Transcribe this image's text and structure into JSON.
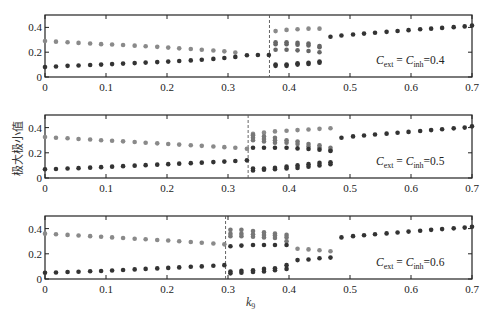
{
  "chart_data": [
    {
      "type": "scatter",
      "annotation": {
        "c1": "C",
        "s1": "ext",
        "eq": " = ",
        "c2": "C",
        "s2": "inh",
        "val": "=0.4"
      },
      "xlim": [
        0,
        0.7
      ],
      "ylim": [
        0,
        0.5
      ],
      "xticks": [
        "0",
        "0.1",
        "0.2",
        "0.3",
        "0.4",
        "0.5",
        "0.6",
        "0.7"
      ],
      "yticks": [
        "0",
        "0.2",
        "0.4"
      ],
      "dashed_x": 0.368,
      "series": [
        {
          "name": "upper",
          "color": "#8a8a8a",
          "x": [
            0,
            0.018,
            0.037,
            0.055,
            0.074,
            0.092,
            0.11,
            0.128,
            0.147,
            0.165,
            0.184,
            0.202,
            0.22,
            0.239,
            0.257,
            0.276,
            0.294,
            0.312
          ],
          "y": [
            0.29,
            0.285,
            0.28,
            0.275,
            0.27,
            0.265,
            0.262,
            0.258,
            0.253,
            0.248,
            0.243,
            0.237,
            0.231,
            0.226,
            0.22,
            0.214,
            0.207,
            0.198
          ]
        },
        {
          "name": "lower",
          "color": "#333333",
          "x": [
            0,
            0.018,
            0.037,
            0.055,
            0.074,
            0.092,
            0.11,
            0.128,
            0.147,
            0.165,
            0.184,
            0.202,
            0.22,
            0.239,
            0.257,
            0.276,
            0.294,
            0.312,
            0.331,
            0.349,
            0.367
          ],
          "y": [
            0.08,
            0.085,
            0.09,
            0.093,
            0.097,
            0.1,
            0.104,
            0.108,
            0.112,
            0.116,
            0.12,
            0.124,
            0.129,
            0.134,
            0.139,
            0.146,
            0.153,
            0.162,
            0.175,
            0.178,
            0.178
          ]
        },
        {
          "name": "periodic-high",
          "color": "#8a8a8a",
          "x": [
            0.378,
            0.396,
            0.414,
            0.432,
            0.45
          ],
          "y": [
            0.37,
            0.38,
            0.385,
            0.39,
            0.39
          ]
        },
        {
          "name": "periodic-mid",
          "color": "#666666",
          "x": [
            0.378,
            0.378,
            0.396,
            0.396,
            0.414,
            0.414,
            0.432,
            0.432,
            0.45,
            0.45,
            0.378,
            0.396,
            0.414,
            0.432,
            0.45
          ],
          "y": [
            0.28,
            0.265,
            0.28,
            0.265,
            0.275,
            0.26,
            0.27,
            0.255,
            0.25,
            0.24,
            0.22,
            0.22,
            0.215,
            0.21,
            0.2
          ]
        },
        {
          "name": "periodic-low",
          "color": "#333333",
          "x": [
            0.378,
            0.378,
            0.396,
            0.396,
            0.414,
            0.414,
            0.432,
            0.432,
            0.45,
            0.45
          ],
          "y": [
            0.1,
            0.09,
            0.1,
            0.09,
            0.11,
            0.1,
            0.115,
            0.105,
            0.125,
            0.115
          ]
        },
        {
          "name": "upper-branch",
          "color": "#333333",
          "x": [
            0.468,
            0.486,
            0.505,
            0.523,
            0.541,
            0.56,
            0.578,
            0.596,
            0.615,
            0.633,
            0.651,
            0.67,
            0.688,
            0.7
          ],
          "y": [
            0.325,
            0.335,
            0.343,
            0.35,
            0.357,
            0.364,
            0.371,
            0.378,
            0.385,
            0.39,
            0.396,
            0.402,
            0.408,
            0.415
          ]
        }
      ]
    },
    {
      "type": "scatter",
      "annotation": {
        "c1": "C",
        "s1": "ext",
        "eq": " = ",
        "c2": "C",
        "s2": "inh",
        "val": "=0.5"
      },
      "xlim": [
        0,
        0.7
      ],
      "ylim": [
        0,
        0.5
      ],
      "xticks": [
        "0",
        "0.1",
        "0.2",
        "0.3",
        "0.4",
        "0.5",
        "0.6",
        "0.7"
      ],
      "yticks": [
        "0",
        "0.2",
        "0.4"
      ],
      "dashed_x": 0.333,
      "series": [
        {
          "name": "upper",
          "color": "#8a8a8a",
          "x": [
            0,
            0.018,
            0.037,
            0.055,
            0.074,
            0.092,
            0.11,
            0.128,
            0.147,
            0.165,
            0.184,
            0.202,
            0.22,
            0.239,
            0.257,
            0.276,
            0.294,
            0.312,
            0.331
          ],
          "y": [
            0.325,
            0.32,
            0.315,
            0.31,
            0.305,
            0.3,
            0.296,
            0.291,
            0.286,
            0.28,
            0.275,
            0.27,
            0.265,
            0.26,
            0.255,
            0.25,
            0.245,
            0.24,
            0.232
          ]
        },
        {
          "name": "lower",
          "color": "#333333",
          "x": [
            0,
            0.018,
            0.037,
            0.055,
            0.074,
            0.092,
            0.11,
            0.128,
            0.147,
            0.165,
            0.184,
            0.202,
            0.22,
            0.239,
            0.257,
            0.276,
            0.294,
            0.312,
            0.331
          ],
          "y": [
            0.07,
            0.072,
            0.075,
            0.078,
            0.082,
            0.086,
            0.09,
            0.094,
            0.098,
            0.102,
            0.106,
            0.11,
            0.114,
            0.118,
            0.122,
            0.126,
            0.13,
            0.135,
            0.14
          ]
        },
        {
          "name": "periodic-high",
          "color": "#8a8a8a",
          "x": [
            0.341,
            0.359,
            0.377,
            0.396,
            0.414,
            0.432,
            0.45,
            0.468
          ],
          "y": [
            0.35,
            0.36,
            0.37,
            0.375,
            0.38,
            0.385,
            0.39,
            0.395
          ]
        },
        {
          "name": "periodic-mid",
          "color": "#777777",
          "x": [
            0.341,
            0.341,
            0.341,
            0.359,
            0.359,
            0.359,
            0.377,
            0.377,
            0.377,
            0.396,
            0.396,
            0.414,
            0.414,
            0.432,
            0.432,
            0.45,
            0.45,
            0.468,
            0.468
          ],
          "y": [
            0.34,
            0.32,
            0.3,
            0.33,
            0.31,
            0.29,
            0.32,
            0.3,
            0.28,
            0.3,
            0.28,
            0.29,
            0.27,
            0.27,
            0.25,
            0.26,
            0.24,
            0.24,
            0.22
          ]
        },
        {
          "name": "periodic-mid-dark",
          "color": "#333333",
          "x": [
            0.341,
            0.359,
            0.377,
            0.396,
            0.414,
            0.432,
            0.45,
            0.468
          ],
          "y": [
            0.24,
            0.24,
            0.24,
            0.24,
            0.235,
            0.23,
            0.225,
            0.215
          ]
        },
        {
          "name": "periodic-low",
          "color": "#333333",
          "x": [
            0.341,
            0.341,
            0.359,
            0.359,
            0.377,
            0.377,
            0.396,
            0.396,
            0.414,
            0.414,
            0.432,
            0.432,
            0.45,
            0.45,
            0.468,
            0.468
          ],
          "y": [
            0.075,
            0.06,
            0.075,
            0.065,
            0.08,
            0.07,
            0.09,
            0.075,
            0.1,
            0.08,
            0.11,
            0.09,
            0.12,
            0.1,
            0.125,
            0.11
          ]
        },
        {
          "name": "upper-branch",
          "color": "#333333",
          "x": [
            0.486,
            0.505,
            0.523,
            0.541,
            0.56,
            0.578,
            0.596,
            0.615,
            0.633,
            0.651,
            0.67,
            0.688,
            0.7
          ],
          "y": [
            0.32,
            0.33,
            0.337,
            0.345,
            0.352,
            0.359,
            0.366,
            0.373,
            0.38,
            0.387,
            0.394,
            0.4,
            0.41
          ]
        }
      ]
    },
    {
      "type": "scatter",
      "annotation": {
        "c1": "C",
        "s1": "ext",
        "eq": " = ",
        "c2": "C",
        "s2": "inh",
        "val": "=0.6"
      },
      "xlim": [
        0,
        0.7
      ],
      "ylim": [
        0,
        0.5
      ],
      "xticks": [
        "0",
        "0.1",
        "0.2",
        "0.3",
        "0.4",
        "0.5",
        "0.6",
        "0.7"
      ],
      "yticks": [
        "0",
        "0.2",
        "0.4"
      ],
      "dashed_x": 0.296,
      "series": [
        {
          "name": "upper",
          "color": "#8a8a8a",
          "x": [
            0,
            0.018,
            0.037,
            0.055,
            0.074,
            0.092,
            0.11,
            0.128,
            0.147,
            0.165,
            0.184,
            0.202,
            0.22,
            0.239,
            0.257,
            0.276,
            0.294
          ],
          "y": [
            0.36,
            0.355,
            0.35,
            0.345,
            0.34,
            0.335,
            0.33,
            0.325,
            0.32,
            0.315,
            0.31,
            0.305,
            0.3,
            0.294,
            0.288,
            0.282,
            0.275
          ]
        },
        {
          "name": "lower",
          "color": "#333333",
          "x": [
            0,
            0.018,
            0.037,
            0.055,
            0.074,
            0.092,
            0.11,
            0.128,
            0.147,
            0.165,
            0.184,
            0.202,
            0.22,
            0.239,
            0.257,
            0.276,
            0.294
          ],
          "y": [
            0.05,
            0.052,
            0.055,
            0.058,
            0.061,
            0.064,
            0.068,
            0.072,
            0.076,
            0.08,
            0.084,
            0.088,
            0.092,
            0.097,
            0.1,
            0.105,
            0.11
          ]
        },
        {
          "name": "periodic-high",
          "color": "#777777",
          "x": [
            0.304,
            0.304,
            0.304,
            0.322,
            0.322,
            0.322,
            0.341,
            0.341,
            0.341,
            0.359,
            0.359,
            0.359,
            0.377,
            0.377,
            0.377,
            0.396,
            0.396,
            0.396
          ],
          "y": [
            0.39,
            0.36,
            0.34,
            0.39,
            0.36,
            0.34,
            0.38,
            0.355,
            0.335,
            0.37,
            0.35,
            0.33,
            0.36,
            0.345,
            0.325,
            0.35,
            0.33,
            0.3
          ]
        },
        {
          "name": "periodic-mid-dark",
          "color": "#333333",
          "x": [
            0.304,
            0.322,
            0.341,
            0.359,
            0.377,
            0.396
          ],
          "y": [
            0.26,
            0.265,
            0.27,
            0.27,
            0.27,
            0.27
          ]
        },
        {
          "name": "periodic-low",
          "color": "#333333",
          "x": [
            0.304,
            0.304,
            0.322,
            0.322,
            0.341,
            0.341,
            0.359,
            0.359,
            0.377,
            0.377,
            0.396,
            0.396
          ],
          "y": [
            0.06,
            0.045,
            0.065,
            0.05,
            0.07,
            0.055,
            0.08,
            0.06,
            0.085,
            0.07,
            0.11,
            0.08
          ]
        },
        {
          "name": "branch-mid-upper",
          "color": "#8a8a8a",
          "x": [
            0.414,
            0.432,
            0.45,
            0.468
          ],
          "y": [
            0.24,
            0.235,
            0.228,
            0.22
          ]
        },
        {
          "name": "branch-mid-lower",
          "color": "#333333",
          "x": [
            0.414,
            0.432,
            0.45,
            0.468
          ],
          "y": [
            0.15,
            0.155,
            0.165,
            0.17
          ]
        },
        {
          "name": "upper-branch",
          "color": "#333333",
          "x": [
            0.486,
            0.505,
            0.523,
            0.541,
            0.56,
            0.578,
            0.596,
            0.615,
            0.633,
            0.651,
            0.67,
            0.688,
            0.7
          ],
          "y": [
            0.33,
            0.34,
            0.347,
            0.355,
            0.362,
            0.369,
            0.376,
            0.383,
            0.39,
            0.396,
            0.402,
            0.408,
            0.415
          ]
        }
      ]
    }
  ],
  "ylabel": "极大极小值",
  "xlabel": {
    "base": "k",
    "sub": "9"
  }
}
